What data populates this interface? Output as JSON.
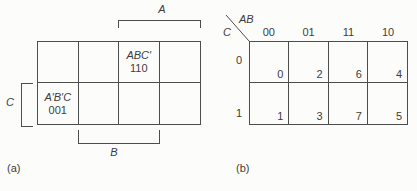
{
  "figure": {
    "map_a": {
      "caption": "(a)",
      "top_bracket_label": "A",
      "bottom_bracket_label": "B",
      "side_bracket_label": "C",
      "cell_abc": {
        "term": "ABC′",
        "code": "110"
      },
      "cell_a1b1c": {
        "term": "A′B′C",
        "code": "001"
      }
    },
    "map_b": {
      "caption": "(b)",
      "corner_var_top": "AB",
      "corner_var_side": "C",
      "col_headers": [
        "00",
        "01",
        "11",
        "10"
      ],
      "row_headers": [
        "0",
        "1"
      ],
      "cell_values": [
        [
          "0",
          "2",
          "6",
          "4"
        ],
        [
          "1",
          "3",
          "7",
          "5"
        ]
      ]
    }
  }
}
